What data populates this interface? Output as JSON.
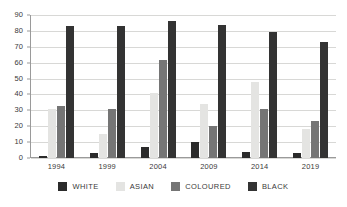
{
  "chart_data": {
    "type": "bar",
    "title": "",
    "subtitle": "",
    "xlabel": "",
    "ylabel": "",
    "categories": [
      "1994",
      "1999",
      "2004",
      "2009",
      "2014",
      "2019"
    ],
    "series": [
      {
        "name": "WHITE",
        "color": "#2b2b2b",
        "values": [
          1,
          3,
          7,
          10,
          4,
          3
        ]
      },
      {
        "name": "ASIAN",
        "color": "#e4e4e2",
        "values": [
          31,
          15,
          41,
          34,
          48,
          18
        ]
      },
      {
        "name": "COLOURED",
        "color": "#757575",
        "values": [
          33,
          31,
          62,
          20,
          31,
          23
        ]
      },
      {
        "name": "BLACK",
        "color": "#333333",
        "values": [
          83,
          83,
          86,
          84,
          79,
          73
        ]
      }
    ],
    "ylim": [
      0,
      90
    ],
    "ytick_values": [
      0,
      10,
      20,
      30,
      40,
      50,
      60,
      70,
      80,
      90
    ],
    "ytick_labels": [
      "0",
      "10",
      "20",
      "30",
      "40",
      "50",
      "60",
      "70",
      "80",
      "90"
    ],
    "grid": true,
    "grid_axis": "y",
    "legend_position": "bottom",
    "legend_entries": [
      "WHITE",
      "ASIAN",
      "COLOURED",
      "BLACK"
    ],
    "annotations": []
  },
  "colors": {
    "background": "#ffffff",
    "axis": "#9a9a9a",
    "gridline": "#d8d8d6",
    "text": "#3a3a3a"
  }
}
